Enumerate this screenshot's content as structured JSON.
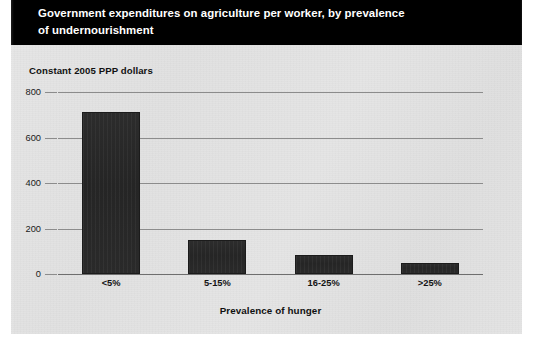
{
  "header": {
    "title": "Government expenditures on agriculture per worker, by prevalence\nof undernourishment",
    "background_color": "#000000",
    "text_color": "#ffffff"
  },
  "panel": {
    "background_color": "#e3e3e3"
  },
  "chart_data": {
    "type": "bar",
    "title": "Government expenditures on agriculture per worker, by prevalence of undernourishment",
    "subtitle": "Constant 2005 PPP dollars",
    "categories": [
      "<5%",
      "5-15%",
      "16-25%",
      ">25%"
    ],
    "values": [
      710,
      150,
      85,
      50
    ],
    "xlabel": "Prevalence of hunger",
    "ylabel": "Constant 2005 PPP dollars",
    "ylim": [
      0,
      800
    ],
    "yticks": [
      0,
      200,
      400,
      600,
      800
    ],
    "ytick_labels": [
      "0",
      "200",
      "400",
      "600",
      "800"
    ],
    "grid": true,
    "legend": "none",
    "bar_color": "#2b2b2b",
    "gridline_color": "#8c8c8c"
  }
}
